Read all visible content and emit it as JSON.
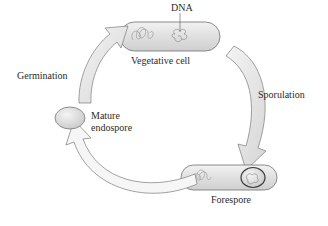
{
  "diagram": {
    "type": "life-cycle",
    "title": "",
    "stages": [
      {
        "id": "vegetative",
        "label": "Vegetative cell"
      },
      {
        "id": "forespore",
        "label": "Forespore"
      },
      {
        "id": "mature",
        "label_line1": "Mature",
        "label_line2": "endospore"
      }
    ],
    "transitions": [
      {
        "from": "vegetative",
        "to": "forespore",
        "label": "Sporulation"
      },
      {
        "from": "forespore",
        "to": "mature",
        "label": ""
      },
      {
        "from": "mature",
        "to": "vegetative",
        "label": "Germination"
      }
    ],
    "annotations": {
      "dna": "DNA"
    },
    "colors": {
      "cell_fill": "#e4e4e4",
      "cell_stroke": "#6e6e6e",
      "arrow_fill": "#e6e6e6",
      "arrow_stroke": "#7a7a7a"
    }
  }
}
